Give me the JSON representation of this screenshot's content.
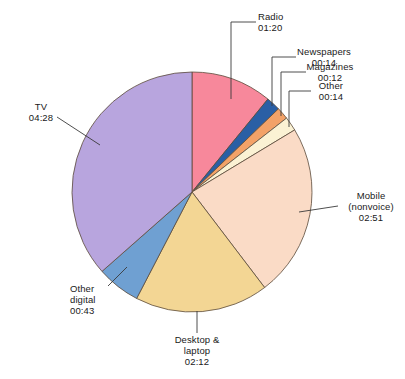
{
  "chart_data": {
    "type": "pie",
    "title": "",
    "subtitle": "",
    "xlabel": "",
    "ylabel": "",
    "legend_position": "none",
    "grid": false,
    "value_format": "hh:mm",
    "total": "12:14",
    "categories": [
      "TV",
      "Mobile (nonvoice)",
      "Desktop & laptop",
      "Radio",
      "Other digital",
      "Newspapers",
      "Other",
      "Magazines"
    ],
    "values": [
      268,
      171,
      132,
      80,
      43,
      14,
      14,
      12
    ],
    "value_labels": [
      "04:28",
      "02:51",
      "02:12",
      "01:20",
      "00:43",
      "00:14",
      "00:14",
      "00:12"
    ],
    "slices": [
      {
        "name": "Radio",
        "label_line1": "Radio",
        "label_line2": "",
        "value_label": "01:20",
        "minutes": 80,
        "color": "#f7889b",
        "start_angle": 0.0,
        "end_angle": 39.24
      },
      {
        "name": "Newspapers",
        "label_line1": "Newspapers",
        "label_line2": "",
        "value_label": "00:14",
        "minutes": 14,
        "color": "#2a5fa5",
        "start_angle": 39.24,
        "end_angle": 46.1
      },
      {
        "name": "Magazines",
        "label_line1": "Magazines",
        "label_line2": "",
        "value_label": "00:12",
        "minutes": 12,
        "color": "#f3a268",
        "start_angle": 46.1,
        "end_angle": 51.99
      },
      {
        "name": "Other",
        "label_line1": "Other",
        "label_line2": "",
        "value_label": "00:14",
        "minutes": 14,
        "color": "#fbf2d4",
        "start_angle": 51.99,
        "end_angle": 58.85
      },
      {
        "name": "Mobile (nonvoice)",
        "label_line1": "Mobile",
        "label_line2": "(nonvoice)",
        "value_label": "02:51",
        "minutes": 171,
        "color": "#fadbc6",
        "start_angle": 58.85,
        "end_angle": 142.75
      },
      {
        "name": "Desktop & laptop",
        "label_line1": "Desktop &",
        "label_line2": "laptop",
        "value_label": "02:12",
        "minutes": 132,
        "color": "#f3d694",
        "start_angle": 142.75,
        "end_angle": 207.49
      },
      {
        "name": "Other digital",
        "label_line1": "Other",
        "label_line2": "digital",
        "value_label": "00:43",
        "minutes": 43,
        "color": "#6fa0d2",
        "start_angle": 207.49,
        "end_angle": 228.58
      },
      {
        "name": "TV",
        "label_line1": "TV",
        "label_line2": "",
        "value_label": "04:28",
        "minutes": 268,
        "color": "#b8a5de",
        "start_angle": 228.58,
        "end_angle": 360.0
      }
    ],
    "geometry": {
      "cx": 192,
      "cy": 192,
      "r": 120,
      "stroke": "#5a4a3a",
      "stroke_width": 0.8
    }
  },
  "labels": {
    "radio": {
      "line1": "Radio",
      "line2": "01:20"
    },
    "newspapers": {
      "line1": "Newspapers",
      "line2": "00:14"
    },
    "magazines": {
      "line1": "Magazines",
      "line2": "00:12"
    },
    "other": {
      "line1": "Other",
      "line2": "00:14"
    },
    "mobile": {
      "line1": "Mobile",
      "line2": "(nonvoice)",
      "line3": "02:51"
    },
    "desktop": {
      "line1": "Desktop &",
      "line2": "laptop",
      "line3": "02:12"
    },
    "other_digital": {
      "line1": "Other",
      "line2": "digital",
      "line3": "00:43"
    },
    "tv": {
      "line1": "TV",
      "line2": "04:28"
    }
  },
  "colors": {
    "radio": "#f7889b",
    "newspapers": "#2a5fa5",
    "magazines": "#f3a268",
    "other": "#fbf2d4",
    "mobile": "#fadbc6",
    "desktop": "#f3d694",
    "other_digital": "#6fa0d2",
    "tv": "#b8a5de",
    "outline": "#5a4a3a",
    "leader": "#3a3a3a",
    "text": "#1a1a1a",
    "background": "#ffffff"
  }
}
